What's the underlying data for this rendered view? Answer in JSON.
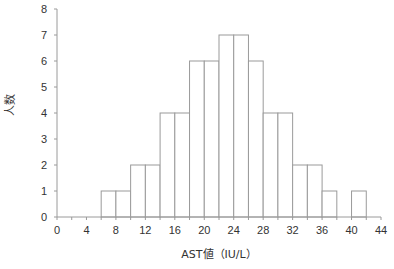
{
  "chart_data": {
    "type": "bar",
    "title": "",
    "xlabel": "AST値（IU/L）",
    "ylabel": "人数",
    "xlim": [
      0,
      44
    ],
    "ylim": [
      0,
      8
    ],
    "x_ticks": [
      0,
      4,
      8,
      12,
      16,
      20,
      24,
      28,
      32,
      36,
      40,
      44
    ],
    "y_ticks": [
      0,
      1,
      2,
      3,
      4,
      5,
      6,
      7,
      8
    ],
    "grid": false,
    "bin_width": 2,
    "bins": [
      {
        "from": 6,
        "to": 8,
        "count": 1
      },
      {
        "from": 8,
        "to": 10,
        "count": 1
      },
      {
        "from": 10,
        "to": 12,
        "count": 2
      },
      {
        "from": 12,
        "to": 14,
        "count": 2
      },
      {
        "from": 14,
        "to": 16,
        "count": 4
      },
      {
        "from": 16,
        "to": 18,
        "count": 4
      },
      {
        "from": 18,
        "to": 20,
        "count": 6
      },
      {
        "from": 20,
        "to": 22,
        "count": 6
      },
      {
        "from": 22,
        "to": 24,
        "count": 7
      },
      {
        "from": 24,
        "to": 26,
        "count": 7
      },
      {
        "from": 26,
        "to": 28,
        "count": 6
      },
      {
        "from": 28,
        "to": 30,
        "count": 4
      },
      {
        "from": 30,
        "to": 32,
        "count": 4
      },
      {
        "from": 32,
        "to": 34,
        "count": 2
      },
      {
        "from": 34,
        "to": 36,
        "count": 2
      },
      {
        "from": 36,
        "to": 38,
        "count": 1
      },
      {
        "from": 38,
        "to": 40,
        "count": 0
      },
      {
        "from": 40,
        "to": 42,
        "count": 1
      }
    ],
    "colors": {
      "bar_fill": "#ffffff",
      "bar_stroke": "#9a9a9a",
      "axis": "#9a9a9a",
      "text": "#333333"
    }
  }
}
